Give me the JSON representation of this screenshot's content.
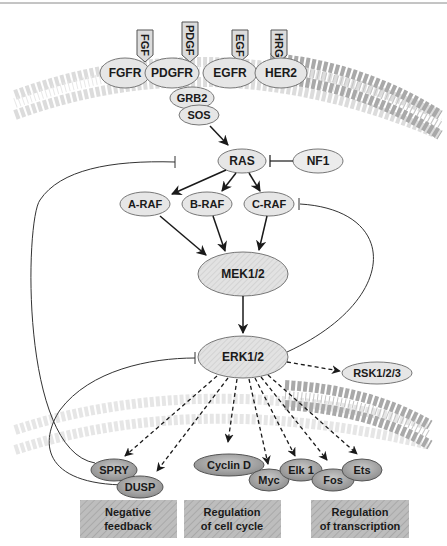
{
  "ligands": [
    {
      "label": "FGF"
    },
    {
      "label": "PDGF"
    },
    {
      "label": "EGF"
    },
    {
      "label": "HRG"
    }
  ],
  "receptors": [
    {
      "label": "FGFR"
    },
    {
      "label": "PDGFR"
    },
    {
      "label": "EGFR"
    },
    {
      "label": "HER2"
    }
  ],
  "adaptors": [
    {
      "label": "GRB2"
    },
    {
      "label": "SOS"
    }
  ],
  "ras": {
    "label": "RAS"
  },
  "nf1": {
    "label": "NF1"
  },
  "rafs": [
    {
      "label": "A-RAF"
    },
    {
      "label": "B-RAF"
    },
    {
      "label": "C-RAF"
    }
  ],
  "mek": {
    "label": "MEK1/2"
  },
  "erk": {
    "label": "ERK1/2"
  },
  "rsk": {
    "label": "RSK1/2/3"
  },
  "targets": [
    {
      "label": "SPRY"
    },
    {
      "label": "DUSP"
    },
    {
      "label": "Cyclin D"
    },
    {
      "label": "Myc"
    },
    {
      "label": "Elk 1"
    },
    {
      "label": "Fos"
    },
    {
      "label": "Ets"
    }
  ],
  "outcomes": [
    {
      "line1": "Negative",
      "line2": "feedback"
    },
    {
      "line1": "Regulation",
      "line2": "of cell cycle"
    },
    {
      "line1": "Regulation",
      "line2": "of transcription"
    }
  ],
  "colors": {
    "node_fill": "#e6e6e6",
    "target_fill": "#a8a8a8",
    "outcome_fill": "#b4b4b4",
    "membrane_light": "#dcdcdc",
    "membrane_dark": "#a9a9a9",
    "stroke": "#1a1a1a"
  }
}
